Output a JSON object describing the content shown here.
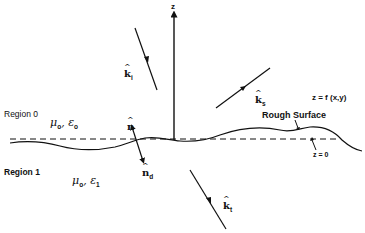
{
  "diagram": {
    "axis": {
      "label": "z"
    },
    "vectors": {
      "incident": {
        "symbol": "k",
        "subscript": "i"
      },
      "scattered": {
        "symbol": "k",
        "subscript": "s"
      },
      "transmitted": {
        "symbol": "k",
        "subscript": "t"
      },
      "normal": {
        "symbol": "n",
        "subscript": ""
      },
      "normal_down": {
        "symbol": "n",
        "subscript": "d"
      }
    },
    "surface": {
      "equation": "z = f (x,y)",
      "name": "Rough Surface",
      "mean_plane": "z = 0"
    },
    "regions": [
      {
        "name": "Region 0",
        "mu": "μ",
        "mu_sub": "o",
        "eps": "ε",
        "eps_sub": "o"
      },
      {
        "name": "Region 1",
        "mu": "μ",
        "mu_sub": "o",
        "eps": "ε",
        "eps_sub": "1"
      }
    ],
    "colors": {
      "ink": "#111111",
      "background": "#ffffff"
    }
  }
}
